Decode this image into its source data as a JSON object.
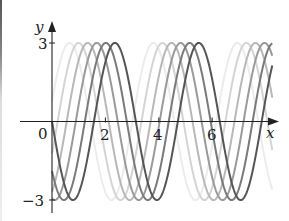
{
  "chart_data": {
    "type": "line",
    "title": "",
    "xlabel": "x",
    "ylabel": "y",
    "xlim": [
      0,
      8.25
    ],
    "ylim": [
      -3,
      3
    ],
    "x_ticks": [
      0,
      2,
      4,
      6
    ],
    "x_tick_labels": [
      "0",
      "2",
      "4",
      "6"
    ],
    "y_ticks": [
      3,
      -3
    ],
    "y_tick_labels": [
      "3",
      "−3"
    ],
    "grid": false,
    "legend": "none",
    "series": [
      {
        "name": "y = 3 sin(2(x + 1.70) − π)",
        "amplitude": 3,
        "frequency": 2,
        "shift": 1.7,
        "color": "#ececec"
      },
      {
        "name": "y = 3 sin(2(x + 1.36) − π)",
        "amplitude": 3,
        "frequency": 2,
        "shift": 1.36,
        "color": "#d4d4d4"
      },
      {
        "name": "y = 3 sin(2(x + 1.02) − π)",
        "amplitude": 3,
        "frequency": 2,
        "shift": 1.02,
        "color": "#b8b8b8"
      },
      {
        "name": "y = 3 sin(2(x + 0.68) − π)",
        "amplitude": 3,
        "frequency": 2,
        "shift": 0.68,
        "color": "#9a9a9a"
      },
      {
        "name": "y = 3 sin(2(x + 0.34) − π)",
        "amplitude": 3,
        "frequency": 2,
        "shift": 0.34,
        "color": "#7a7a7a"
      },
      {
        "name": "y = −3 sin(2x)",
        "amplitude": 3,
        "frequency": 2,
        "shift": 0.0,
        "color": "#555555"
      }
    ]
  },
  "axes": {
    "x_label": "x",
    "y_label": "y",
    "origin_label": "0",
    "x_tick_labels": [
      "2",
      "4",
      "6"
    ],
    "y_top_label": "3",
    "y_bottom_label": "−3"
  }
}
